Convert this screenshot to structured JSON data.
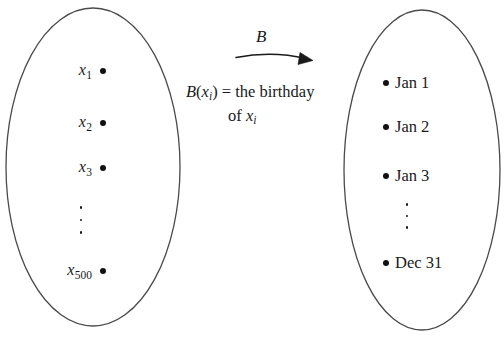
{
  "figure": {
    "background_color": "#ffffff",
    "stroke_color": "#4a4a4a",
    "dot_color": "#111111"
  },
  "domain_set": {
    "name": "domain-ellipse",
    "items": [
      {
        "label": "x",
        "subscript": "1"
      },
      {
        "label": "x",
        "subscript": "2"
      },
      {
        "label": "x",
        "subscript": "3"
      },
      {
        "label": "x",
        "subscript": "500"
      }
    ],
    "ellipsis": "vertical-dots"
  },
  "codomain_set": {
    "name": "codomain-ellipse",
    "items": [
      {
        "label": "Jan 1"
      },
      {
        "label": "Jan 2"
      },
      {
        "label": "Jan 3"
      },
      {
        "label": "Dec 31"
      }
    ],
    "ellipsis": "vertical-dots"
  },
  "mapping": {
    "arrow_label": "B",
    "arrow_direction": "left-to-right",
    "definition_line1_prefix": "B",
    "definition_line1": "(x",
    "definition_line1_sub": "i",
    "definition_line1_mid": ") = the birthday",
    "definition_line2_prefix": "of ",
    "definition_line2_var": "x",
    "definition_line2_sub": "i",
    "definition_full": "B(x_i) = the birthday of x_i"
  }
}
